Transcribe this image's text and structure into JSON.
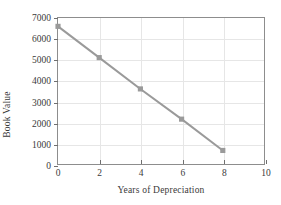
{
  "chart_data": {
    "type": "line",
    "title": "",
    "xlabel": "Years of Depreciation",
    "ylabel": "Book Value",
    "xlim": [
      0,
      10
    ],
    "ylim": [
      0,
      7000
    ],
    "xticks": [
      0,
      2,
      4,
      6,
      8,
      10
    ],
    "yticks": [
      0,
      1000,
      2000,
      3000,
      4000,
      5000,
      6000,
      7000
    ],
    "xtick_labels": [
      "0",
      "2",
      "4",
      "6",
      "8",
      "10"
    ],
    "ytick_labels": [
      "0",
      "1000",
      "2000",
      "3000",
      "4000",
      "5000",
      "6000",
      "7000"
    ],
    "grid": true,
    "legend": false,
    "series": [
      {
        "name": "Book Value",
        "x": [
          0,
          2,
          4,
          6,
          8
        ],
        "values": [
          6600,
          5100,
          3600,
          2150,
          650
        ],
        "color": "#9a9a9a",
        "marker": "square",
        "line_width": 2
      }
    ],
    "colors": {
      "line": "#9a9a9a",
      "marker": "#9a9a9a",
      "grid": "#e6e6e6",
      "axis": "#8d8d8d",
      "tick": "#6f6f6f",
      "text": "#3a3a3a",
      "background": "#ffffff"
    }
  }
}
